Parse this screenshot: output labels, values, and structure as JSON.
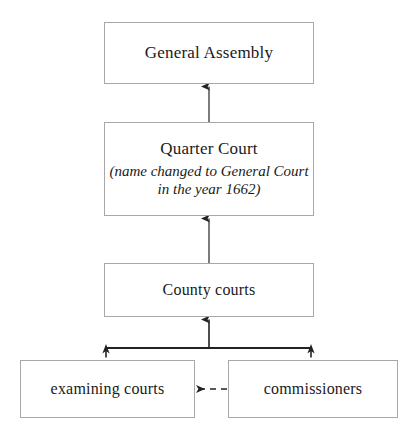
{
  "diagram": {
    "background_color": "#ffffff",
    "line_color": "#222222",
    "box_border_color": "#a8a8a8",
    "text_color": "#1a1a1a",
    "nodes": [
      {
        "id": "general-assembly",
        "label": "General Assembly",
        "note": ""
      },
      {
        "id": "quarter-court",
        "label": "Quarter Court",
        "note": "(name changed to General Court in the year 1662)"
      },
      {
        "id": "county-courts",
        "label": "County courts",
        "note": ""
      },
      {
        "id": "examining-courts",
        "label": "examining courts",
        "note": ""
      },
      {
        "id": "commissioners",
        "label": "commissioners",
        "note": ""
      }
    ],
    "edges": [
      {
        "id": "quarter-to-assembly",
        "from": "quarter-court",
        "to": "general-assembly",
        "style": "solid",
        "arrow": "up"
      },
      {
        "id": "county-to-quarter",
        "from": "county-courts",
        "to": "quarter-court",
        "style": "solid",
        "arrow": "up"
      },
      {
        "id": "bracket-to-county",
        "from": "examining-courts,commissioners",
        "to": "county-courts",
        "style": "solid",
        "arrow": "up"
      },
      {
        "id": "commissioners-to-examining",
        "from": "commissioners",
        "to": "examining-courts",
        "style": "dashed",
        "arrow": "left"
      }
    ]
  }
}
